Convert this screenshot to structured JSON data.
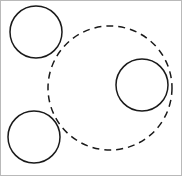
{
  "figure": {
    "title": "",
    "width": 182,
    "height": 176,
    "background_color": "#ffffff",
    "stroke_color": "#1a1a1a",
    "border_color": "#b9b9b9"
  },
  "chart_data": {
    "type": "diagram",
    "title": "",
    "subtitle": "",
    "xlabel": "",
    "ylabel": "",
    "legend": [],
    "annotations": [],
    "grid": false,
    "coordinate_space": {
      "units": "pixels",
      "origin": "top-left",
      "xlim": [
        0,
        182
      ],
      "ylim": [
        0,
        176
      ]
    },
    "shapes": [
      {
        "name": "large-dashed-circle",
        "shape": "circle",
        "cx": 110,
        "cy": 88,
        "r": 62,
        "stroke_style": "dashed",
        "stroke_color": "#1a1a1a",
        "stroke_width": 1.5,
        "dash_pattern": "7 5",
        "fill": "none"
      },
      {
        "name": "top-left-solid-circle",
        "shape": "circle",
        "cx": 36,
        "cy": 32,
        "r": 26,
        "stroke_style": "solid",
        "stroke_color": "#1a1a1a",
        "stroke_width": 1.5,
        "dash_pattern": "",
        "fill": "none"
      },
      {
        "name": "bottom-left-solid-circle",
        "shape": "circle",
        "cx": 34,
        "cy": 137,
        "r": 26,
        "stroke_style": "solid",
        "stroke_color": "#1a1a1a",
        "stroke_width": 1.5,
        "dash_pattern": "",
        "fill": "none"
      },
      {
        "name": "right-solid-circle",
        "shape": "circle",
        "cx": 142,
        "cy": 85,
        "r": 26,
        "stroke_style": "solid",
        "stroke_color": "#1a1a1a",
        "stroke_width": 1.5,
        "dash_pattern": "",
        "fill": "none"
      }
    ]
  }
}
